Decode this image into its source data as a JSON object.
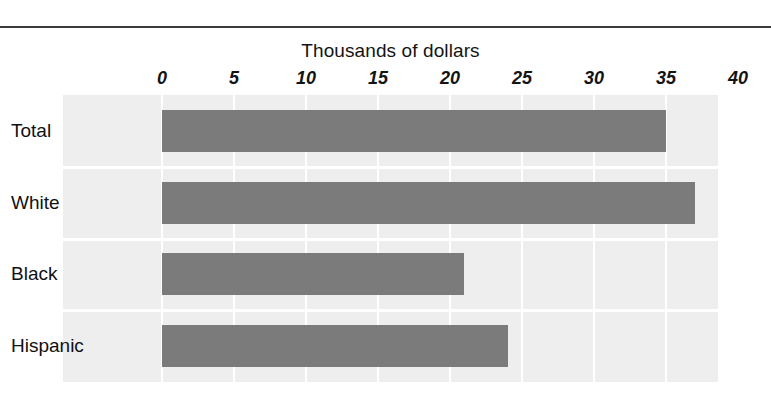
{
  "figure": {
    "width": 771,
    "height": 402,
    "background_color": "#ffffff",
    "rule_color": "#3a3a3a"
  },
  "chart_data": {
    "type": "bar",
    "orientation": "horizontal",
    "title": "Thousands of dollars",
    "xlabel": "",
    "ylabel": "",
    "categories": [
      "Total",
      "White",
      "Black",
      "Hispanic"
    ],
    "values": [
      35,
      37,
      21,
      24
    ],
    "series": [
      {
        "name": "Median earnings",
        "values": [
          35,
          37,
          21,
          24
        ]
      }
    ],
    "xlim": [
      0,
      40
    ],
    "xticks": [
      0,
      5,
      10,
      15,
      20,
      25,
      30,
      35,
      40
    ],
    "xtick_labels": [
      "0",
      "5",
      "10",
      "15",
      "20",
      "25",
      "30",
      "35",
      "40"
    ],
    "grid": true,
    "grid_axis": "x",
    "grid_color": "#ffffff",
    "legend": false,
    "legend_position": "none",
    "bar_color": "#7b7b7b",
    "plot_background_color": "#eeeeee"
  }
}
